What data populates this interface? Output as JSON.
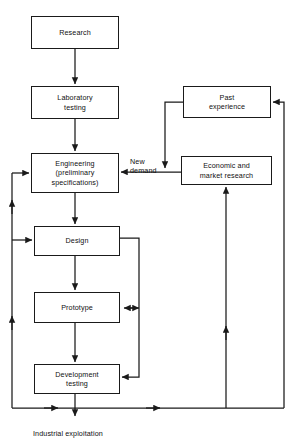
{
  "diagram": {
    "stroke_color": "#1a1a1a",
    "text_color": "#111111",
    "background": "#ffffff",
    "nodes": [
      {
        "id": "research",
        "label": "Research",
        "x": 31,
        "y": 16,
        "w": 88,
        "h": 33
      },
      {
        "id": "lab",
        "label": "Laboratory\ntesting",
        "x": 31,
        "y": 86,
        "w": 88,
        "h": 33
      },
      {
        "id": "eng",
        "label": "Engineering\n(preliminary\nspecifications)",
        "x": 31,
        "y": 153,
        "w": 88,
        "h": 40
      },
      {
        "id": "design",
        "label": "Design",
        "x": 34,
        "y": 226,
        "w": 86,
        "h": 30
      },
      {
        "id": "prototype",
        "label": "Prototype",
        "x": 34,
        "y": 292,
        "w": 86,
        "h": 31
      },
      {
        "id": "devtest",
        "label": "Development\ntesting",
        "x": 34,
        "y": 364,
        "w": 86,
        "h": 30
      },
      {
        "id": "past",
        "label": "Past\nexperience",
        "x": 183,
        "y": 86,
        "w": 88,
        "h": 32
      },
      {
        "id": "econ",
        "label": "Economic and\nmarket research",
        "x": 181,
        "y": 156,
        "w": 91,
        "h": 29
      }
    ],
    "labels": [
      {
        "id": "new-demand",
        "text": "New\ndemand",
        "x": 130,
        "y": 147
      },
      {
        "id": "industrial-exploitation",
        "text": "Industrial exploitation",
        "x": 33,
        "y": 419
      }
    ],
    "connections": [
      {
        "id": "research-to-lab",
        "from": "research",
        "to": "lab"
      },
      {
        "id": "lab-to-eng",
        "from": "lab",
        "to": "eng"
      },
      {
        "id": "eng-to-design",
        "from": "eng",
        "to": "design"
      },
      {
        "id": "design-to-prototype",
        "from": "design",
        "to": "prototype"
      },
      {
        "id": "prototype-to-devtest",
        "from": "prototype",
        "to": "devtest"
      },
      {
        "id": "devtest-to-exploitation",
        "from": "devtest",
        "to": "industrial-exploitation"
      },
      {
        "id": "past-to-new-demand",
        "from": "past",
        "to": "eng"
      },
      {
        "id": "econ-to-eng",
        "from": "econ",
        "to": "eng"
      },
      {
        "id": "design-loop-right",
        "from": "design",
        "to": "devtest"
      },
      {
        "id": "prototype-loop-both",
        "from": "prototype",
        "to": "design"
      },
      {
        "id": "feedback-left-to-eng",
        "from": "devtest",
        "to": "eng"
      },
      {
        "id": "feedback-left-to-design",
        "from": "devtest",
        "to": "design"
      },
      {
        "id": "feedback-bottom-to-econ",
        "from": "devtest",
        "to": "econ"
      },
      {
        "id": "feedback-bottom-to-past",
        "from": "devtest",
        "to": "past"
      }
    ]
  }
}
